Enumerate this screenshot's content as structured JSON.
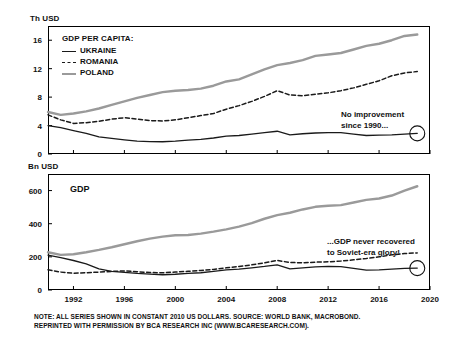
{
  "figure": {
    "footnote_line1": "NOTE: ALL SERIES SHOWN IN CONSTANT 2010 US DOLLARS. SOURCE: WORLD BANK, MACROBOND.",
    "footnote_line2": "REPRINTED WITH PERMISSION BY BCA RESEARCH INC (WWW.BCARESEARCH.COM)."
  },
  "colors": {
    "ukraine": "#1a1a1a",
    "romania": "#1a1a1a",
    "poland": "#9a9a9a",
    "frame": "#000000",
    "text": "#111111"
  },
  "legend": {
    "title": "GDP PER CAPITA:",
    "items": [
      {
        "label": "UKRAINE",
        "style": "solid"
      },
      {
        "label": "ROMANIA",
        "style": "dashed"
      },
      {
        "label": "POLAND",
        "style": "solid-gray"
      }
    ]
  },
  "annotations": {
    "top": {
      "line1": "No improvement",
      "line2": "since 1990..."
    },
    "bottom": {
      "line1": "...GDP never recovered",
      "line2": "to Soviet-era glory!"
    }
  },
  "chart_data": [
    {
      "type": "line",
      "id": "gdp-per-capita",
      "title": "GDP PER CAPITA:",
      "ylabel": "Th USD",
      "xlabel": "",
      "ylim": [
        0,
        18
      ],
      "yticks": [
        0,
        4,
        8,
        12,
        16
      ],
      "ytick_labels": [
        "0",
        "4",
        "8",
        "12",
        "16"
      ],
      "xlim": [
        1990,
        2020
      ],
      "xticks": [
        1992,
        1996,
        2000,
        2004,
        2008,
        2012,
        2016,
        2020
      ],
      "xtick_labels": [
        "1992",
        "1996",
        "2000",
        "2004",
        "2008",
        "2012",
        "2016",
        "2020"
      ],
      "grid": false,
      "legend_position": "top-left",
      "x": [
        1990,
        1991,
        1992,
        1993,
        1994,
        1995,
        1996,
        1997,
        1998,
        1999,
        2000,
        2001,
        2002,
        2003,
        2004,
        2005,
        2006,
        2007,
        2008,
        2009,
        2010,
        2011,
        2012,
        2013,
        2014,
        2015,
        2016,
        2017,
        2018,
        2019
      ],
      "series": [
        {
          "name": "UKRAINE",
          "style": "solid",
          "color": "#1a1a1a",
          "values": [
            4.0,
            3.7,
            3.3,
            2.9,
            2.4,
            2.2,
            2.0,
            1.8,
            1.75,
            1.72,
            1.8,
            1.95,
            2.05,
            2.25,
            2.5,
            2.6,
            2.8,
            3.0,
            3.2,
            2.7,
            2.85,
            2.95,
            3.0,
            3.0,
            2.8,
            2.6,
            2.65,
            2.7,
            2.8,
            2.9
          ]
        },
        {
          "name": "ROMANIA",
          "style": "dashed",
          "color": "#1a1a1a",
          "values": [
            5.5,
            4.8,
            4.3,
            4.4,
            4.6,
            4.9,
            5.1,
            4.9,
            4.7,
            4.65,
            4.8,
            5.1,
            5.4,
            5.7,
            6.3,
            6.8,
            7.4,
            8.1,
            8.9,
            8.3,
            8.2,
            8.4,
            8.6,
            8.9,
            9.3,
            9.8,
            10.3,
            11.0,
            11.4,
            11.6
          ]
        },
        {
          "name": "POLAND",
          "style": "solid-gray",
          "color": "#9a9a9a",
          "values": [
            5.9,
            5.5,
            5.7,
            6.0,
            6.4,
            6.9,
            7.4,
            7.9,
            8.3,
            8.7,
            8.9,
            9.0,
            9.2,
            9.6,
            10.2,
            10.5,
            11.2,
            11.9,
            12.5,
            12.8,
            13.2,
            13.8,
            14.0,
            14.2,
            14.7,
            15.2,
            15.5,
            16.0,
            16.6,
            16.8
          ]
        }
      ]
    },
    {
      "type": "line",
      "id": "gdp",
      "title": "GDP",
      "ylabel": "Bn USD",
      "xlabel": "",
      "ylim": [
        0,
        700
      ],
      "yticks": [
        0,
        200,
        400,
        600
      ],
      "ytick_labels": [
        "0",
        "200",
        "400",
        "600"
      ],
      "xlim": [
        1990,
        2020
      ],
      "xticks": [
        1992,
        1996,
        2000,
        2004,
        2008,
        2012,
        2016,
        2020
      ],
      "xtick_labels": [
        "1992",
        "1996",
        "2000",
        "2004",
        "2008",
        "2012",
        "2016",
        "2020"
      ],
      "grid": false,
      "legend_position": "none",
      "x": [
        1990,
        1991,
        1992,
        1993,
        1994,
        1995,
        1996,
        1997,
        1998,
        1999,
        2000,
        2001,
        2002,
        2003,
        2004,
        2005,
        2006,
        2007,
        2008,
        2009,
        2010,
        2011,
        2012,
        2013,
        2014,
        2015,
        2016,
        2017,
        2018,
        2019
      ],
      "series": [
        {
          "name": "UKRAINE",
          "style": "solid",
          "color": "#1a1a1a",
          "values": [
            210,
            196,
            178,
            158,
            128,
            112,
            106,
            100,
            96,
            92,
            95,
            100,
            104,
            112,
            122,
            126,
            134,
            142,
            152,
            128,
            134,
            140,
            142,
            141,
            130,
            120,
            122,
            126,
            130,
            132
          ]
        },
        {
          "name": "ROMANIA",
          "style": "dashed",
          "color": "#1a1a1a",
          "values": [
            122,
            108,
            101,
            104,
            108,
            112,
            115,
            110,
            106,
            104,
            108,
            113,
            118,
            124,
            134,
            142,
            152,
            164,
            178,
            166,
            164,
            168,
            170,
            175,
            182,
            190,
            200,
            212,
            220,
            224
          ]
        },
        {
          "name": "POLAND",
          "style": "solid-gray",
          "color": "#9a9a9a",
          "values": [
            228,
            212,
            216,
            228,
            242,
            258,
            276,
            294,
            310,
            322,
            330,
            332,
            340,
            352,
            366,
            382,
            404,
            430,
            452,
            466,
            486,
            502,
            508,
            512,
            528,
            544,
            552,
            570,
            600,
            626
          ]
        }
      ]
    }
  ]
}
